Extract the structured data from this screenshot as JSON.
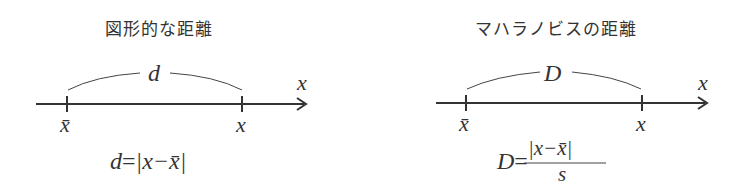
{
  "left": {
    "title": "図形的な距離",
    "distance_symbol": "d",
    "axis_label": "x",
    "tick_left_label": "x̄",
    "tick_right_label": "x",
    "formula_lhs": "d",
    "formula_eq": "=",
    "formula_rhs": "|x−x̄|"
  },
  "right": {
    "title": "マハラノビスの距離",
    "distance_symbol": "D",
    "axis_label": "x",
    "tick_left_label": "x̄",
    "tick_right_label": "x",
    "formula_lhs": "D",
    "formula_eq": "=",
    "formula_numerator": "|x−x̄|",
    "formula_denominator": "s"
  }
}
